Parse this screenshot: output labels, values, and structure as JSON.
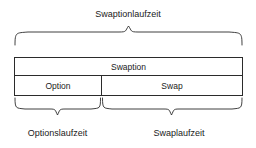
{
  "diagram": {
    "title_top": "Swaptionlaufzeit",
    "box": {
      "header_label": "Swaption",
      "cells": [
        {
          "label": "Option"
        },
        {
          "label": "Swap"
        }
      ]
    },
    "labels_bottom": [
      {
        "label": "Optionslaufzeit"
      },
      {
        "label": "Swaplaufzeit"
      }
    ],
    "colors": {
      "stroke": "#2b2b2b",
      "text": "#1a1a1a",
      "background": "#ffffff"
    },
    "braces": {
      "top": {
        "name": "brace-up-swaptionlaufzeit",
        "direction": "up",
        "span_from": 14,
        "span_to": 243
      },
      "bottom_left": {
        "name": "brace-down-optionslaufzeit",
        "direction": "down",
        "span_from": 14,
        "span_to": 101
      },
      "bottom_right": {
        "name": "brace-down-swaplaufzeit",
        "direction": "down",
        "span_from": 101,
        "span_to": 243
      }
    }
  }
}
